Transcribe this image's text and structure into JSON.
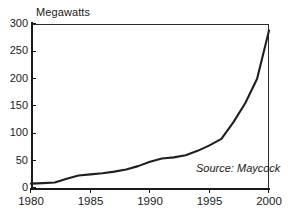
{
  "chart_data": {
    "type": "line",
    "title": "",
    "ylabel": "Megawatts",
    "xlabel": "",
    "xlim": [
      1980,
      2000
    ],
    "ylim": [
      0,
      300
    ],
    "grid": false,
    "legend": false,
    "annotation": "Source: Maycock",
    "ytick_labels": [
      "300",
      "250",
      "200",
      "150",
      "100",
      "50",
      "0"
    ],
    "ytick_values": [
      300,
      250,
      200,
      150,
      100,
      50,
      0
    ],
    "xtick_labels": [
      "1980",
      "1985",
      "1990",
      "1995",
      "2000"
    ],
    "xtick_values": [
      1980,
      1985,
      1990,
      1995,
      2000
    ],
    "series": [
      {
        "name": "Megawatts",
        "color": "#1f1f1f",
        "x": [
          1980,
          1981,
          1982,
          1983,
          1984,
          1985,
          1986,
          1987,
          1988,
          1989,
          1990,
          1991,
          1992,
          1993,
          1994,
          1995,
          1996,
          1997,
          1998,
          1999,
          2000
        ],
        "values": [
          8,
          9,
          10,
          17,
          23,
          25,
          27,
          30,
          34,
          40,
          48,
          54,
          56,
          60,
          68,
          78,
          90,
          120,
          155,
          200,
          288
        ]
      }
    ]
  },
  "axis": {
    "y_title": "Megawatts"
  },
  "annotation": {
    "source": "Source: Maycock"
  }
}
